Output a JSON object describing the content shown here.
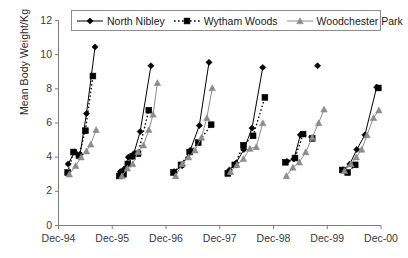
{
  "chart_data": {
    "type": "line",
    "title": "",
    "subtitle": "",
    "xlabel": "",
    "ylabel": "Mean Body Weight/Kg",
    "grid": false,
    "legend_position": "top-inside",
    "x_tick_labels": [
      "Dec-94",
      "Dec-95",
      "Dec-96",
      "Dec-97",
      "Dec-98",
      "Dec-99",
      "Dec-00"
    ],
    "x_tick_values": [
      0,
      1,
      2,
      3,
      4,
      5,
      6
    ],
    "y_tick_labels": [
      "0",
      "2",
      "4",
      "6",
      "8",
      "10",
      "12"
    ],
    "y_tick_values": [
      0,
      2,
      4,
      6,
      8,
      10,
      12
    ],
    "ylim": [
      0,
      12
    ],
    "xlim": [
      0,
      6
    ],
    "series": [
      {
        "name": "North Nibley",
        "color": "#000000",
        "marker": "diamond",
        "line_style": "solid",
        "points": [
          {
            "x": 0.18,
            "y": 3.6
          },
          {
            "x": 0.3,
            "y": 4.3
          },
          {
            "x": 0.4,
            "y": 4.15
          },
          {
            "x": 0.52,
            "y": 6.55
          },
          {
            "x": 0.68,
            "y": 10.45
          },
          {
            "x": 1.15,
            "y": 3.15
          },
          {
            "x": 1.22,
            "y": 3.3
          },
          {
            "x": 1.3,
            "y": 4.0
          },
          {
            "x": 1.4,
            "y": 4.2
          },
          {
            "x": 1.52,
            "y": 5.5
          },
          {
            "x": 1.72,
            "y": 9.35
          },
          {
            "x": 2.15,
            "y": 3.15
          },
          {
            "x": 2.3,
            "y": 3.5
          },
          {
            "x": 2.45,
            "y": 4.4
          },
          {
            "x": 2.62,
            "y": 5.85
          },
          {
            "x": 2.8,
            "y": 9.55
          },
          {
            "x": 3.18,
            "y": 3.25
          },
          {
            "x": 3.3,
            "y": 3.65
          },
          {
            "x": 3.45,
            "y": 4.45
          },
          {
            "x": 3.6,
            "y": 5.7
          },
          {
            "x": 3.8,
            "y": 9.25
          },
          {
            "x": 4.25,
            "y": 3.75
          },
          {
            "x": 4.38,
            "y": 3.9
          },
          {
            "x": 4.5,
            "y": 5.3
          },
          {
            "x": 4.82,
            "y": 9.35
          },
          {
            "x": 5.3,
            "y": 3.25
          },
          {
            "x": 5.42,
            "y": 3.6
          },
          {
            "x": 5.55,
            "y": 4.45
          },
          {
            "x": 5.7,
            "y": 5.3
          },
          {
            "x": 5.92,
            "y": 8.1
          }
        ]
      },
      {
        "name": "Wytham Woods",
        "color": "#000000",
        "marker": "square",
        "line_style": "dashed",
        "points": [
          {
            "x": 0.17,
            "y": 3.1
          },
          {
            "x": 0.28,
            "y": 4.3
          },
          {
            "x": 0.38,
            "y": 4.1
          },
          {
            "x": 0.5,
            "y": 5.55
          },
          {
            "x": 0.64,
            "y": 8.75
          },
          {
            "x": 1.13,
            "y": 2.9
          },
          {
            "x": 1.21,
            "y": 3.0
          },
          {
            "x": 1.29,
            "y": 3.6
          },
          {
            "x": 1.38,
            "y": 4.05
          },
          {
            "x": 1.48,
            "y": 4.2
          },
          {
            "x": 1.68,
            "y": 6.75
          },
          {
            "x": 2.14,
            "y": 3.1
          },
          {
            "x": 2.28,
            "y": 3.55
          },
          {
            "x": 2.44,
            "y": 4.3
          },
          {
            "x": 2.6,
            "y": 4.85
          },
          {
            "x": 2.84,
            "y": 5.9
          },
          {
            "x": 3.15,
            "y": 3.05
          },
          {
            "x": 3.28,
            "y": 3.55
          },
          {
            "x": 3.44,
            "y": 4.7
          },
          {
            "x": 3.62,
            "y": 5.25
          },
          {
            "x": 3.84,
            "y": 7.5
          },
          {
            "x": 4.22,
            "y": 3.7
          },
          {
            "x": 4.4,
            "y": 3.95
          },
          {
            "x": 4.55,
            "y": 5.35
          },
          {
            "x": 4.72,
            "y": 5.1
          },
          {
            "x": 5.28,
            "y": 3.25
          },
          {
            "x": 5.38,
            "y": 3.1
          },
          {
            "x": 5.52,
            "y": 3.55
          },
          {
            "x": 5.95,
            "y": 8.05
          }
        ]
      },
      {
        "name": "Woodchester Park",
        "color": "#8c8c8c",
        "marker": "triangle",
        "line_style": "solid",
        "points": [
          {
            "x": 0.2,
            "y": 3.0
          },
          {
            "x": 0.32,
            "y": 3.5
          },
          {
            "x": 0.42,
            "y": 4.0
          },
          {
            "x": 0.52,
            "y": 4.35
          },
          {
            "x": 0.6,
            "y": 4.75
          },
          {
            "x": 0.7,
            "y": 5.6
          },
          {
            "x": 1.18,
            "y": 2.9
          },
          {
            "x": 1.28,
            "y": 3.35
          },
          {
            "x": 1.38,
            "y": 3.6
          },
          {
            "x": 1.48,
            "y": 4.3
          },
          {
            "x": 1.58,
            "y": 4.7
          },
          {
            "x": 1.68,
            "y": 5.6
          },
          {
            "x": 1.76,
            "y": 6.5
          },
          {
            "x": 1.84,
            "y": 8.35
          },
          {
            "x": 2.18,
            "y": 2.9
          },
          {
            "x": 2.3,
            "y": 3.6
          },
          {
            "x": 2.42,
            "y": 4.0
          },
          {
            "x": 2.54,
            "y": 4.4
          },
          {
            "x": 2.66,
            "y": 5.15
          },
          {
            "x": 2.76,
            "y": 6.3
          },
          {
            "x": 2.86,
            "y": 8.05
          },
          {
            "x": 3.2,
            "y": 3.15
          },
          {
            "x": 3.32,
            "y": 3.55
          },
          {
            "x": 3.44,
            "y": 3.9
          },
          {
            "x": 3.56,
            "y": 4.5
          },
          {
            "x": 3.68,
            "y": 4.6
          },
          {
            "x": 3.8,
            "y": 6.0
          },
          {
            "x": 4.24,
            "y": 2.9
          },
          {
            "x": 4.36,
            "y": 3.4
          },
          {
            "x": 4.48,
            "y": 3.7
          },
          {
            "x": 4.6,
            "y": 4.3
          },
          {
            "x": 4.72,
            "y": 5.15
          },
          {
            "x": 4.84,
            "y": 6.0
          },
          {
            "x": 4.94,
            "y": 6.8
          },
          {
            "x": 5.32,
            "y": 3.2
          },
          {
            "x": 5.44,
            "y": 3.6
          },
          {
            "x": 5.54,
            "y": 4.0
          },
          {
            "x": 5.64,
            "y": 4.45
          },
          {
            "x": 5.74,
            "y": 5.3
          },
          {
            "x": 5.86,
            "y": 6.3
          },
          {
            "x": 5.96,
            "y": 6.75
          }
        ]
      }
    ]
  },
  "legend": {
    "entries": [
      {
        "label": "North Nibley"
      },
      {
        "label": "Wytham Woods"
      },
      {
        "label": "Woodchester Park"
      }
    ]
  },
  "axes": {
    "y_title": "Mean Body Weight/Kg"
  }
}
